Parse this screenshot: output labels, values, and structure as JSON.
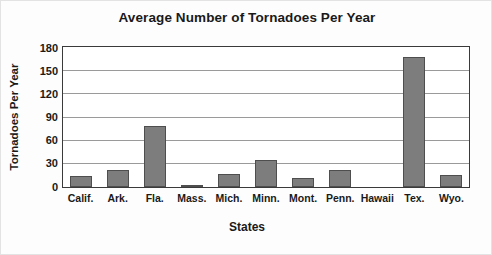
{
  "chart_data": {
    "type": "bar",
    "title": "Average Number of Tornadoes Per Year",
    "xlabel": "States",
    "ylabel": "Tornadoes Per Year",
    "categories": [
      "Calif.",
      "Ark.",
      "Fla.",
      "Mass.",
      "Mich.",
      "Minn.",
      "Mont.",
      "Penn.",
      "Hawaii",
      "Tex.",
      "Wyo."
    ],
    "values": [
      14,
      22,
      79,
      2,
      17,
      35,
      12,
      22,
      0,
      169,
      15
    ],
    "ylim": [
      0,
      180
    ],
    "yticks": [
      0,
      30,
      60,
      90,
      120,
      150,
      180
    ],
    "ytick_labels": [
      "0",
      "30",
      "60",
      "90",
      "120",
      "150",
      "180"
    ],
    "grid": true,
    "legend": false,
    "bar_color": "#7d7d7d",
    "bar_border_color": "#4e4e4e",
    "plot_background": "#ffffff",
    "axis_color": "#3a3a3a",
    "gridline_color": "#9a9a9a",
    "text_color": "#1a1a1a"
  }
}
